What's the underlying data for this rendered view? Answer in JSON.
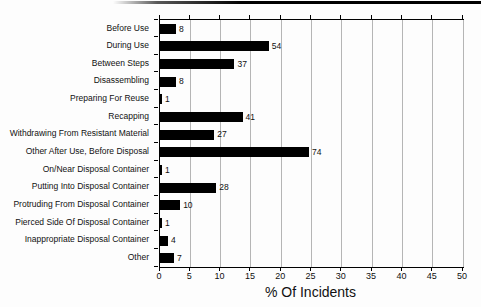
{
  "figure": {
    "background": "#fdfdfd",
    "top_rule_color": "#000000"
  },
  "chart_data": {
    "type": "bar",
    "orientation": "horizontal",
    "title": "",
    "xlabel": "% Of Incidents",
    "ylabel": "",
    "categories": [
      "Before Use",
      "During Use",
      "Between Steps",
      "Disassembling",
      "Preparing For Reuse",
      "Recapping",
      "Withdrawing From Resistant Material",
      "Other After Use, Before Disposal",
      "On/Near Disposal Container",
      "Putting Into Disposal Container",
      "Protruding From Disposal Container",
      "Pierced Side Of Disposal Container",
      "Inappropriate Disposal Container",
      "Other"
    ],
    "values": [
      8,
      54,
      37,
      8,
      1,
      41,
      27,
      74,
      1,
      28,
      10,
      1,
      4,
      7
    ],
    "total": 301,
    "note": "Numeric labels are raw incident counts; bar length is count as % of total (sum = 301) on the 0-50% axis",
    "xlim": [
      0,
      50
    ],
    "xticks": [
      0,
      5,
      10,
      15,
      20,
      25,
      30,
      35,
      40,
      45,
      50
    ],
    "grid": "vertical",
    "legend": "none",
    "bar_color": "#000000",
    "grid_color": "#b5b5b5",
    "frame_color": "#000000"
  }
}
